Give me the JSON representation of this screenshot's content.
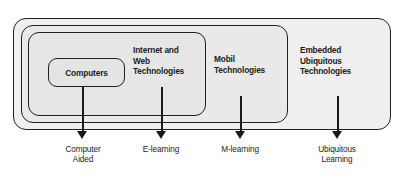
{
  "figure": {
    "type": "nested-venn-diagram",
    "top_cropped_caption": "",
    "nested_boxes": [
      {
        "level": 0,
        "label": "Embedded\nUbiquitous\nTechnologies"
      },
      {
        "level": 1,
        "label": "Mobil\nTechnologies"
      },
      {
        "level": 2,
        "label": "Internet and\nWeb\nTechnologies"
      },
      {
        "level": 3,
        "label": "Computers"
      }
    ],
    "arrows": [
      {
        "from": "Computers",
        "label": "Computer\nAided"
      },
      {
        "from": "Internet and Web Technologies",
        "label": "E-learning"
      },
      {
        "from": "Mobil Technologies",
        "label": "M-learning"
      },
      {
        "from": "Embedded Ubiquitous Technologies",
        "label": "Ubiquitous\nLearning"
      }
    ],
    "colors": {
      "outline": "#231f20",
      "fill_outer": "#efefef",
      "fill_inner": "#e4e4e4",
      "text": "#1c1c1c",
      "arrow": "#1a1a1a",
      "background": "#ffffff"
    }
  }
}
